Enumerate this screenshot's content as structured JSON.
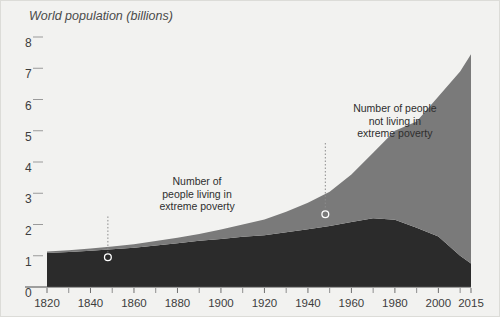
{
  "chart_data": {
    "type": "area",
    "title": "World population (billions)",
    "xlabel": "",
    "ylabel": "World population (billions)",
    "xlim": [
      1820,
      2015
    ],
    "ylim": [
      0,
      8
    ],
    "grid": false,
    "stacked": true,
    "legend_position": "none",
    "x_tick_labels": [
      "1820",
      "1840",
      "1860",
      "1880",
      "1900",
      "1920",
      "1940",
      "1960",
      "1980",
      "2000",
      "2015"
    ],
    "x_tick_values": [
      1820,
      1840,
      1860,
      1880,
      1900,
      1920,
      1940,
      1960,
      1980,
      2000,
      2015
    ],
    "x_minor_tick_values": [
      1830,
      1850,
      1870,
      1890,
      1910,
      1930,
      1950,
      1970,
      1990,
      2010
    ],
    "y_tick_labels": [
      "0",
      "1",
      "2",
      "3",
      "4",
      "5",
      "6",
      "7",
      "8"
    ],
    "y_tick_values": [
      0,
      1,
      2,
      3,
      4,
      5,
      6,
      7,
      8
    ],
    "x": [
      1820,
      1830,
      1840,
      1850,
      1860,
      1870,
      1880,
      1890,
      1900,
      1910,
      1920,
      1930,
      1940,
      1950,
      1960,
      1970,
      1980,
      1990,
      2000,
      2010,
      2015
    ],
    "series": [
      {
        "name": "Number of people living in extreme poverty",
        "color": "#2b2b2b",
        "values": [
          1.09,
          1.12,
          1.16,
          1.21,
          1.26,
          1.33,
          1.4,
          1.48,
          1.54,
          1.61,
          1.66,
          1.75,
          1.85,
          1.95,
          2.08,
          2.2,
          2.15,
          1.9,
          1.62,
          1.0,
          0.75
        ]
      },
      {
        "name": "Number of people not living in extreme poverty",
        "color": "#7a7a7a",
        "values": [
          0.05,
          0.06,
          0.07,
          0.09,
          0.11,
          0.14,
          0.18,
          0.22,
          0.3,
          0.39,
          0.5,
          0.66,
          0.85,
          1.1,
          1.52,
          2.1,
          2.85,
          3.4,
          4.48,
          5.9,
          6.7
        ]
      }
    ],
    "totals": [
      1.14,
      1.18,
      1.23,
      1.3,
      1.37,
      1.47,
      1.58,
      1.7,
      1.84,
      2.0,
      2.16,
      2.41,
      2.7,
      3.05,
      3.6,
      4.3,
      5.0,
      5.3,
      6.1,
      6.9,
      7.45
    ],
    "annotations": [
      {
        "id": "poverty-annotation",
        "lines": [
          "Number of",
          "people living in",
          "extreme poverty"
        ],
        "text_x": 1889,
        "text_y": 3.25,
        "point_x": 1848,
        "point_y": 0.95
      },
      {
        "id": "non-poverty-annotation",
        "lines": [
          "Number of people",
          "not living in",
          "extreme poverty"
        ],
        "text_x": 1980,
        "text_y": 5.6,
        "point_x": 1948,
        "point_y": 2.33
      }
    ]
  },
  "colors": {
    "background": "#f2f2f0",
    "border": "#dcdcd8",
    "poverty_band": "#2b2b2b",
    "non_poverty_band": "#7a7a7a",
    "axis": "#4a4a4a",
    "text": "#3d3d3d",
    "marker_stroke": "#ffffff"
  }
}
